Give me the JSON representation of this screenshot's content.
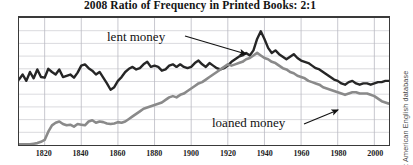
{
  "chart_data": {
    "type": "line",
    "title": "2008 Ratio of Frequency in Printed Books: 2:1",
    "xlabel": "",
    "ylabel": "",
    "xlim": [
      1806,
      2008
    ],
    "ylim": [
      0,
      10
    ],
    "grid": true,
    "grid_x_step": 20,
    "grid_y_step": 1,
    "legend_position": "inline-annotations",
    "source": "Google Ngram: American English database",
    "x_tick_labels": [
      "1820",
      "1840",
      "1860",
      "1880",
      "1900",
      "1920",
      "1940",
      "1960",
      "1980",
      "2000"
    ],
    "x_ticks": [
      1820,
      1840,
      1860,
      1880,
      1900,
      1920,
      1940,
      1960,
      1980,
      2000
    ],
    "annotations": [
      {
        "id": "lent",
        "text": "lent money",
        "points_to_series": "lent money",
        "arrow_from": [
          185,
          36
        ],
        "arrow_to": [
          246,
          54
        ]
      },
      {
        "id": "loaned",
        "text": "loaned money",
        "points_to_series": "loaned money",
        "arrow_from": [
          304,
          124
        ],
        "arrow_to": [
          338,
          110
        ]
      }
    ],
    "series": [
      {
        "name": "lent money",
        "color": "#262626",
        "width": 2.4,
        "x": [
          1806,
          1808,
          1810,
          1812,
          1814,
          1816,
          1818,
          1820,
          1822,
          1824,
          1826,
          1828,
          1830,
          1832,
          1834,
          1836,
          1838,
          1840,
          1842,
          1844,
          1846,
          1848,
          1850,
          1852,
          1854,
          1856,
          1858,
          1860,
          1862,
          1864,
          1866,
          1868,
          1870,
          1872,
          1874,
          1876,
          1878,
          1880,
          1882,
          1884,
          1886,
          1888,
          1890,
          1892,
          1894,
          1896,
          1898,
          1900,
          1902,
          1904,
          1906,
          1908,
          1910,
          1912,
          1914,
          1916,
          1918,
          1920,
          1922,
          1924,
          1926,
          1928,
          1930,
          1932,
          1934,
          1936,
          1938,
          1940,
          1942,
          1944,
          1946,
          1948,
          1950,
          1952,
          1954,
          1956,
          1958,
          1960,
          1962,
          1964,
          1966,
          1968,
          1970,
          1972,
          1974,
          1976,
          1978,
          1980,
          1982,
          1984,
          1986,
          1988,
          1990,
          1992,
          1994,
          1996,
          1998,
          2000,
          2002,
          2004,
          2006,
          2008
        ],
        "values": [
          5.15,
          5.55,
          5.05,
          5.75,
          5.25,
          5.95,
          5.35,
          5.3,
          6.0,
          5.75,
          5.55,
          5.95,
          5.35,
          5.45,
          5.55,
          5.3,
          5.7,
          6.25,
          6.35,
          6.05,
          5.85,
          5.55,
          5.75,
          5.3,
          4.85,
          4.35,
          4.55,
          5.05,
          5.35,
          5.75,
          6.0,
          6.15,
          5.95,
          6.05,
          6.35,
          6.55,
          6.15,
          6.25,
          6.15,
          5.85,
          5.95,
          6.25,
          6.35,
          6.15,
          6.35,
          6.15,
          6.05,
          6.15,
          6.45,
          6.65,
          6.35,
          6.15,
          6.45,
          6.25,
          6.05,
          5.95,
          6.05,
          6.25,
          6.55,
          6.75,
          6.95,
          7.05,
          7.25,
          7.05,
          7.45,
          8.35,
          8.95,
          8.35,
          7.65,
          7.25,
          7.45,
          7.15,
          6.95,
          6.75,
          6.95,
          7.15,
          6.85,
          6.65,
          6.55,
          6.45,
          6.25,
          6.05,
          5.95,
          5.75,
          5.55,
          5.35,
          5.15,
          5.05,
          4.85,
          4.75,
          4.95,
          5.05,
          4.85,
          4.75,
          4.85,
          4.85,
          4.75,
          4.85,
          4.95,
          4.95,
          5.05,
          5.05
        ]
      },
      {
        "name": "loaned money",
        "color": "#8a8a8a",
        "width": 2.6,
        "x": [
          1806,
          1808,
          1810,
          1812,
          1814,
          1816,
          1818,
          1820,
          1822,
          1824,
          1826,
          1828,
          1830,
          1832,
          1834,
          1836,
          1838,
          1840,
          1842,
          1844,
          1846,
          1848,
          1850,
          1852,
          1854,
          1856,
          1858,
          1860,
          1862,
          1864,
          1866,
          1868,
          1870,
          1872,
          1874,
          1876,
          1878,
          1880,
          1882,
          1884,
          1886,
          1888,
          1890,
          1892,
          1894,
          1896,
          1898,
          1900,
          1902,
          1904,
          1906,
          1908,
          1910,
          1912,
          1914,
          1916,
          1918,
          1920,
          1922,
          1924,
          1926,
          1928,
          1930,
          1932,
          1934,
          1936,
          1938,
          1940,
          1942,
          1944,
          1946,
          1948,
          1950,
          1952,
          1954,
          1956,
          1958,
          1960,
          1962,
          1964,
          1966,
          1968,
          1970,
          1972,
          1974,
          1976,
          1978,
          1980,
          1982,
          1984,
          1986,
          1988,
          1990,
          1992,
          1994,
          1996,
          1998,
          2000,
          2002,
          2004,
          2006,
          2008
        ],
        "values": [
          0.05,
          0.05,
          0.05,
          0.05,
          0.1,
          0.15,
          0.25,
          0.4,
          1.05,
          1.55,
          1.75,
          1.85,
          1.65,
          1.55,
          1.6,
          1.45,
          1.65,
          1.6,
          1.55,
          1.85,
          1.95,
          1.75,
          1.85,
          1.8,
          1.7,
          1.65,
          1.7,
          1.8,
          1.75,
          1.85,
          2.05,
          2.25,
          2.45,
          2.65,
          2.85,
          2.95,
          3.05,
          3.15,
          3.25,
          3.35,
          3.55,
          3.75,
          3.85,
          3.75,
          3.95,
          4.05,
          4.25,
          4.45,
          4.65,
          4.85,
          4.95,
          5.15,
          5.35,
          5.55,
          5.75,
          5.95,
          6.15,
          6.35,
          6.25,
          6.35,
          6.45,
          6.55,
          6.75,
          6.85,
          7.05,
          7.25,
          7.05,
          6.85,
          6.75,
          6.55,
          6.45,
          6.25,
          6.05,
          5.95,
          5.75,
          5.65,
          5.45,
          5.35,
          5.25,
          5.05,
          4.95,
          4.85,
          4.75,
          4.55,
          4.45,
          4.35,
          4.25,
          4.15,
          4.05,
          3.95,
          4.05,
          4.15,
          4.15,
          4.05,
          4.05,
          4.05,
          3.95,
          3.85,
          3.65,
          3.45,
          3.35,
          3.25
        ]
      }
    ]
  }
}
